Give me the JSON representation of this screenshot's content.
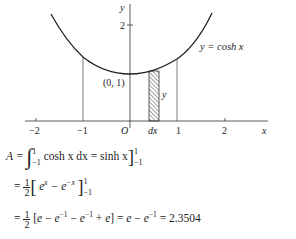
{
  "figure": {
    "y_axis_label": "y",
    "x_axis_label": "x",
    "origin_label": "O",
    "y_tick_label": "2",
    "x_tick_labels": [
      "−2",
      "−1",
      "1",
      "2"
    ],
    "strip_width_label": "dx",
    "strip_height_label": "y",
    "point_label": "(0, 1)",
    "curve_label": "y = cosh x"
  },
  "equations": {
    "line1": {
      "lhs": "A =",
      "integral_upper": "1",
      "integral_lower": "−1",
      "integrand": "cosh x dx = sinh x",
      "eval_upper": "1",
      "eval_lower": "−1"
    },
    "line2": {
      "prefix": "=",
      "frac_num": "1",
      "frac_den": "2",
      "body": "e^x − e^−x",
      "eval_upper": "1",
      "eval_lower": "−1"
    },
    "line3": {
      "prefix": "=",
      "frac_num": "1",
      "frac_den": "2",
      "body": "[e − e^−1 − e^−1 + e] = e − e^−1 = 2.3504"
    }
  }
}
